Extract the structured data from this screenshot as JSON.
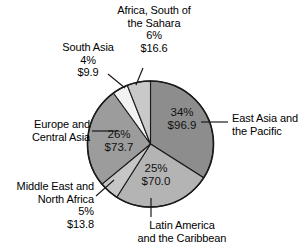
{
  "chart_data": {
    "type": "pie",
    "title": "",
    "unit": "$ billions",
    "legend_position": "callout-labels",
    "grid": false,
    "categories": [
      "East Asia and the Pacific",
      "Latin America and the Caribbean",
      "Middle East and North Africa",
      "Europe and Central Asia",
      "South Asia",
      "Africa, South of the Sahara"
    ],
    "values": [
      96.9,
      70.0,
      13.8,
      73.7,
      9.9,
      16.6
    ],
    "percents": [
      34,
      25,
      5,
      26,
      4,
      6
    ],
    "slices": [
      {
        "name": "East Asia and the Pacific",
        "label": "East Asia and",
        "label_line2": "the Pacific",
        "percent_text": "34%",
        "value_text": "$96.9",
        "percent": 34,
        "value": 96.9,
        "color": "#8d8d8d"
      },
      {
        "name": "Latin America and the Caribbean",
        "label": "Latin America",
        "label_line2": "and the Caribbean",
        "percent_text": "25%",
        "value_text": "$70.0",
        "percent": 25,
        "value": 70.0,
        "color": "#b4b4b4"
      },
      {
        "name": "Middle East and North Africa",
        "label": "Middle East and",
        "label_line2": "North Africa",
        "percent_text": "5%",
        "value_text": "$13.8",
        "percent": 5,
        "value": 13.8,
        "color": "#c6c6c6"
      },
      {
        "name": "Europe and Central Asia",
        "label": "Europe and",
        "label_line2": "Central Asia",
        "percent_text": "26%",
        "value_text": "$73.7",
        "percent": 26,
        "value": 73.7,
        "color": "#9c9c9c"
      },
      {
        "name": "South Asia",
        "label": "South Asia",
        "label_line2": "",
        "percent_text": "4%",
        "value_text": "$9.9",
        "percent": 4,
        "value": 9.9,
        "color": "#f2f2f2"
      },
      {
        "name": "Africa, South of the Sahara",
        "label": "Africa, South of",
        "label_line2": "the Sahara",
        "percent_text": "6%",
        "value_text": "$16.6",
        "percent": 6,
        "value": 16.6,
        "color": "#c9c9c9"
      }
    ]
  },
  "labels": {
    "africa": {
      "line1": "Africa, South of",
      "line2": "the Sahara",
      "percent": "6%",
      "value": "$16.6"
    },
    "south_asia": {
      "line1": "South Asia",
      "percent": "4%",
      "value": "$9.9"
    },
    "east_asia": {
      "line1": "East Asia and",
      "line2": "the Pacific"
    },
    "europe": {
      "line1": "Europe and",
      "line2": "Central Asia"
    },
    "mena": {
      "line1": "Middle East and",
      "line2": "North Africa",
      "percent": "5%",
      "value": "$13.8"
    },
    "latam": {
      "line1": "Latin America",
      "line2": "and the Caribbean"
    }
  },
  "in_slice": {
    "east_asia": {
      "percent": "34%",
      "value": "$96.9"
    },
    "europe": {
      "percent": "26%",
      "value": "$73.7"
    },
    "latam": {
      "percent": "25%",
      "value": "$70.0"
    }
  },
  "colors": {
    "east_asia": "#8d8d8d",
    "latam": "#b4b4b4",
    "mena": "#c6c6c6",
    "europe": "#9c9c9c",
    "south_asia": "#f2f2f2",
    "africa": "#c9c9c9",
    "outline": "#1a1a1a",
    "background": "#ffffff"
  }
}
